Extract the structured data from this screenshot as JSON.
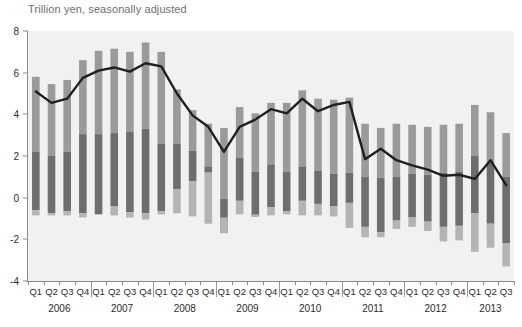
{
  "chart_data": {
    "type": "bar",
    "title": "Trillion yen, seasonally adjusted",
    "xlabel": "",
    "ylabel": "",
    "ylim": [
      -4,
      8
    ],
    "yticks": [
      -4,
      -2,
      0,
      2,
      4,
      6,
      8
    ],
    "ytick_labels": [
      "-4",
      "-2",
      "0",
      "2",
      "4",
      "6",
      "8"
    ],
    "grid": false,
    "legend": "none",
    "stacked": true,
    "categories": [
      "Q1",
      "Q2",
      "Q3",
      "Q4",
      "Q1",
      "Q2",
      "Q3",
      "Q4",
      "Q1",
      "Q2",
      "Q3",
      "Q4",
      "Q1",
      "Q2",
      "Q3",
      "Q4",
      "Q1",
      "Q2",
      "Q3",
      "Q4",
      "Q1",
      "Q2",
      "Q3",
      "Q4",
      "Q1",
      "Q2",
      "Q3",
      "Q4",
      "Q1",
      "Q2",
      "Q3"
    ],
    "years": [
      {
        "label": "2006",
        "start": 0,
        "count": 4
      },
      {
        "label": "2007",
        "start": 4,
        "count": 4
      },
      {
        "label": "2008",
        "start": 8,
        "count": 4
      },
      {
        "label": "2009",
        "start": 12,
        "count": 4
      },
      {
        "label": "2010",
        "start": 16,
        "count": 4
      },
      {
        "label": "2011",
        "start": 20,
        "count": 4
      },
      {
        "label": "2012",
        "start": 24,
        "count": 4
      },
      {
        "label": "2013",
        "start": 28,
        "count": 3
      }
    ],
    "series": [
      {
        "name": "upper-segment",
        "color": "#9a9a9a",
        "values": [
          3.6,
          3.45,
          3.45,
          3.55,
          4.0,
          4.05,
          3.85,
          4.15,
          4.4,
          2.6,
          1.95,
          2.05,
          3.4,
          2.45,
          2.8,
          2.95,
          3.3,
          3.65,
          3.45,
          3.55,
          3.6,
          2.55,
          2.4,
          2.55,
          2.35,
          2.3,
          2.3,
          2.3,
          2.45,
          2.4,
          2.1
        ]
      },
      {
        "name": "middle-segment",
        "color": "#6e6e6e",
        "values": [
          2.8,
          2.75,
          2.85,
          3.8,
          3.85,
          3.5,
          3.85,
          4.05,
          3.25,
          2.2,
          1.45,
          0.3,
          1.65,
          2.05,
          2.15,
          2.05,
          1.9,
          1.65,
          1.6,
          1.55,
          1.45,
          2.4,
          2.6,
          2.1,
          2.1,
          2.25,
          2.6,
          2.6,
          2.75,
          2.95,
          3.2
        ]
      },
      {
        "name": "lower-segment",
        "color": "#b4b4b4",
        "values": [
          0.25,
          0.3,
          0.25,
          0.3,
          0.25,
          0.3,
          0.4,
          0.5,
          0.25,
          0.25,
          0.3,
          0.4,
          0.4,
          0.3,
          0.25,
          0.25,
          0.25,
          0.25,
          0.25,
          0.3,
          0.55,
          0.6,
          0.5,
          0.35,
          0.35,
          0.5,
          0.75,
          0.7,
          1.0,
          0.85,
          1.05
        ]
      }
    ],
    "bar_tops": [
      5.8,
      5.45,
      5.65,
      6.6,
      7.05,
      7.15,
      7.0,
      7.45,
      7.0,
      5.2,
      4.2,
      3.55,
      3.35,
      4.35,
      4.05,
      4.55,
      4.55,
      5.15,
      4.75,
      4.7,
      4.8,
      3.55,
      3.35,
      3.55,
      3.5,
      3.4,
      3.5,
      3.55,
      4.45,
      4.1,
      3.1
    ],
    "bar_bottoms": [
      -0.85,
      -0.85,
      -0.85,
      -0.95,
      -0.8,
      -0.85,
      -0.95,
      -1.05,
      -0.8,
      -0.75,
      -0.9,
      -1.25,
      -0.95,
      -0.8,
      -0.8,
      -0.85,
      -0.8,
      -0.85,
      -0.85,
      -0.9,
      -1.45,
      -1.9,
      -1.9,
      -1.5,
      -1.4,
      -1.6,
      -2.1,
      -2.05,
      -2.6,
      -2.4,
      -3.3
    ],
    "line": {
      "name": "trend-line",
      "color": "#231f20",
      "values": [
        5.1,
        4.55,
        4.75,
        5.75,
        6.1,
        6.25,
        6.05,
        6.45,
        6.3,
        5.0,
        3.95,
        3.4,
        2.2,
        3.4,
        3.75,
        4.25,
        4.05,
        4.75,
        4.15,
        4.45,
        4.6,
        1.85,
        2.35,
        1.8,
        1.55,
        1.35,
        1.05,
        1.1,
        0.9,
        1.8,
        0.6
      ]
    }
  }
}
